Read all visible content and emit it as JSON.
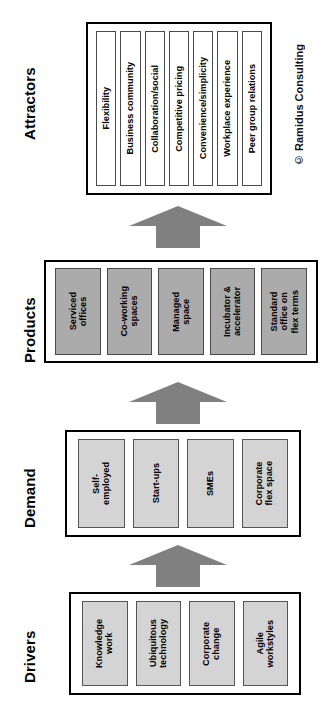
{
  "diagram": {
    "orientation": "rotated-90",
    "copyright": "© Ramidus Consulting",
    "colors": {
      "attractor_box_fill": "#ffffff",
      "demand_box_fill": "#d4d4d4",
      "driver_box_fill": "#d4d4d4",
      "product_box_fill": "#ababab",
      "arrow_fill": "#808080",
      "frame_stroke": "#000000"
    },
    "sections": [
      {
        "id": "attractors",
        "label": "Attractors",
        "fill_style": "white",
        "items": [
          {
            "label": "Flexibility"
          },
          {
            "label": "Business community"
          },
          {
            "label": "Collaboration/social"
          },
          {
            "label": "Competitive pricing"
          },
          {
            "label": "Convenience/simplicity"
          },
          {
            "label": "Workplace experience"
          },
          {
            "label": "Peer group relations"
          }
        ]
      },
      {
        "id": "products",
        "label": "Products",
        "fill_style": "dark",
        "items": [
          {
            "label": "Serviced\noffices"
          },
          {
            "label": "Co-working\nspaces"
          },
          {
            "label": "Managed\nspace"
          },
          {
            "label": "Incubator &\naccelerator"
          },
          {
            "label": "Standard\noffice on\nflex terms"
          }
        ]
      },
      {
        "id": "demand",
        "label": "Demand",
        "fill_style": "light",
        "items": [
          {
            "label": "Self-\nemployed"
          },
          {
            "label": "Start-ups"
          },
          {
            "label": "SMEs"
          },
          {
            "label": "Corporate\nflex space"
          }
        ]
      },
      {
        "id": "drivers",
        "label": "Drivers",
        "fill_style": "light",
        "items": [
          {
            "label": "Knowledge\nwork"
          },
          {
            "label": "Ubiquitous\ntechnology"
          },
          {
            "label": "Corporate\nchange"
          },
          {
            "label": "Agile\nworkstyles"
          }
        ]
      }
    ],
    "arrows": [
      {
        "id": "products-to-attractors",
        "direction": "up"
      },
      {
        "id": "demand-to-products",
        "direction": "up"
      },
      {
        "id": "drivers-to-demand",
        "direction": "up"
      }
    ]
  }
}
